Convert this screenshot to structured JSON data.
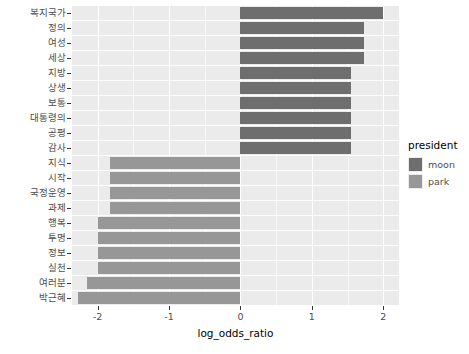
{
  "chart_data": {
    "type": "bar",
    "orientation": "horizontal",
    "title": "",
    "xlabel": "log_odds_ratio",
    "ylabel": "",
    "xlim": [
      -2.36,
      2.22
    ],
    "xticks": [
      -2,
      -1,
      0,
      1,
      2
    ],
    "xticklabels": [
      "-2",
      "-1",
      "0",
      "1",
      "2"
    ],
    "grid": true,
    "legend": {
      "title": "president",
      "position": "right",
      "entries": [
        {
          "name": "moon",
          "color": "#6E6E6E"
        },
        {
          "name": "park",
          "color": "#979797"
        }
      ]
    },
    "categories": [
      "복지국가",
      "정의",
      "여성",
      "세상",
      "지방",
      "상생",
      "보통",
      "대통령의",
      "공평",
      "감사",
      "지식",
      "시작",
      "국정운영",
      "과제",
      "행복",
      "투명",
      "정보",
      "실천",
      "여러분",
      "박근혜"
    ],
    "values": [
      2.0,
      1.73,
      1.73,
      1.73,
      1.55,
      1.55,
      1.55,
      1.55,
      1.55,
      1.55,
      -1.83,
      -1.83,
      -1.83,
      -1.83,
      -2.0,
      -2.0,
      -2.0,
      -2.0,
      -2.15,
      -2.28
    ],
    "groups": [
      "moon",
      "moon",
      "moon",
      "moon",
      "moon",
      "moon",
      "moon",
      "moon",
      "moon",
      "moon",
      "park",
      "park",
      "park",
      "park",
      "park",
      "park",
      "park",
      "park",
      "park",
      "park"
    ]
  }
}
